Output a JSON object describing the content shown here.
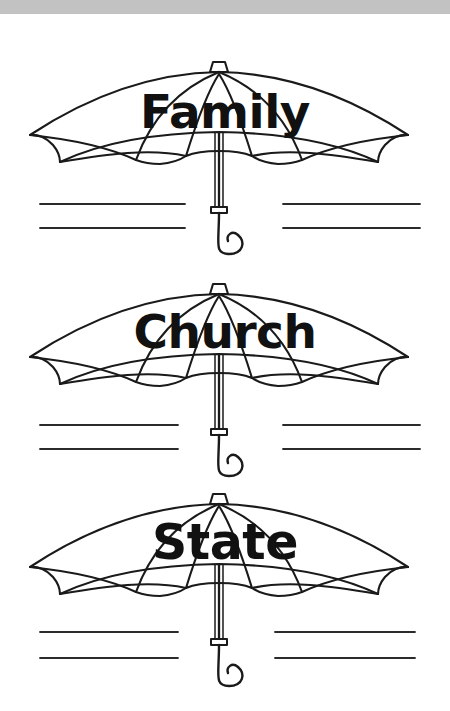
{
  "document": {
    "type": "worksheet",
    "background_color": "#ffffff",
    "top_bar_color": "#c2c2c2",
    "ink_color": "#1a1a1a"
  },
  "items": [
    {
      "id": "umbrella-family",
      "label": "Family",
      "icon_name": "umbrella-icon",
      "writing_lines": 4
    },
    {
      "id": "umbrella-church",
      "label": "Church",
      "icon_name": "umbrella-icon",
      "writing_lines": 4
    },
    {
      "id": "umbrella-state",
      "label": "State",
      "icon_name": "umbrella-icon",
      "writing_lines": 4
    }
  ]
}
